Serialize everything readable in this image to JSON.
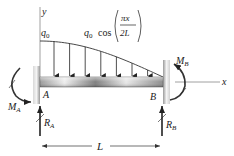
{
  "figure": {
    "type": "beam-free-body-diagram",
    "axes": {
      "y_label": "y",
      "x_label": "x"
    },
    "load": {
      "intensity_label": "q0",
      "intensity_symbol": "q",
      "intensity_subscript": "0",
      "expression_prefix_symbol": "q",
      "expression_prefix_subscript": "0",
      "expression_function": "cos",
      "expression_numerator": "πx",
      "expression_denominator": "2L",
      "distribution": "cosine",
      "arrow_count": 7
    },
    "supports": {
      "left": {
        "point_label": "A",
        "moment_symbol": "M",
        "moment_subscript": "A",
        "reaction_symbol": "R",
        "reaction_subscript": "A"
      },
      "right": {
        "point_label": "B",
        "moment_symbol": "M",
        "moment_subscript": "B",
        "reaction_symbol": "R",
        "reaction_subscript": "B"
      }
    },
    "span": {
      "label": "L"
    }
  },
  "colors": {
    "ink": "#222222",
    "beam_light": "#f0f0f0",
    "beam_dark": "#8a8a8a",
    "axis_line": "#888888"
  }
}
